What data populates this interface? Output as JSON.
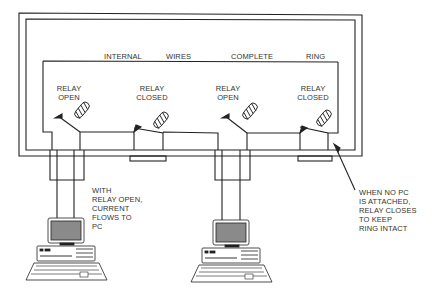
{
  "diagram": {
    "title_labels": {
      "internal": "INTERNAL",
      "wires": "WIRES",
      "complete": "COMPLETE",
      "ring": "RING"
    },
    "relays": [
      {
        "line1": "RELAY",
        "line2": "OPEN",
        "state": "open"
      },
      {
        "line1": "RELAY",
        "line2": "CLOSED",
        "state": "closed"
      },
      {
        "line1": "RELAY",
        "line2": "OPEN",
        "state": "open"
      },
      {
        "line1": "RELAY",
        "line2": "CLOSED",
        "state": "closed"
      }
    ],
    "annotations": {
      "left": [
        "WITH",
        "RELAY OPEN,",
        "CURRENT",
        "FLOWS TO",
        "PC"
      ],
      "right": [
        "WHEN NO PC",
        "IS ATTACHED,",
        "RELAY CLOSES",
        "TO KEEP",
        "RING INTACT"
      ]
    },
    "computers": [
      {
        "name": "pc-1"
      },
      {
        "name": "pc-2"
      }
    ],
    "colors": {
      "line": "#222222",
      "screen": "#8a8a8a",
      "text": "#333333"
    }
  }
}
